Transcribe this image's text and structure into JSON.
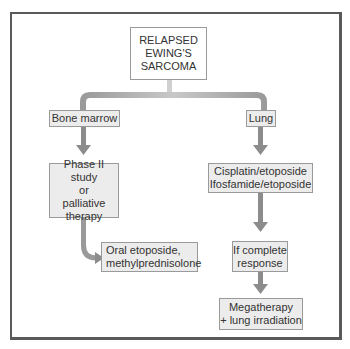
{
  "diagram": {
    "title_node": {
      "lines": [
        "RELAPSED",
        "EWING'S",
        "SARCOMA"
      ]
    },
    "branches": [
      {
        "label": "Bone marrow",
        "steps": [
          {
            "lines": [
              "Phase II study",
              "or",
              "palliative",
              "therapy"
            ]
          },
          {
            "lines": [
              "Oral etoposide,",
              "methylprednisolone"
            ]
          }
        ]
      },
      {
        "label": "Lung",
        "steps": [
          {
            "lines": [
              "Cisplatin/etoposide",
              "Ifosfamide/etoposide"
            ]
          },
          {
            "lines": [
              "If complete",
              "response"
            ]
          },
          {
            "lines": [
              "Megatherapy",
              "+ lung irradiation"
            ]
          }
        ]
      }
    ],
    "colors": {
      "arrow": "#8c8c8c",
      "box_fill": "#ececec",
      "box_border": "#9a9a9a",
      "frame": "#5a5a5a"
    }
  }
}
